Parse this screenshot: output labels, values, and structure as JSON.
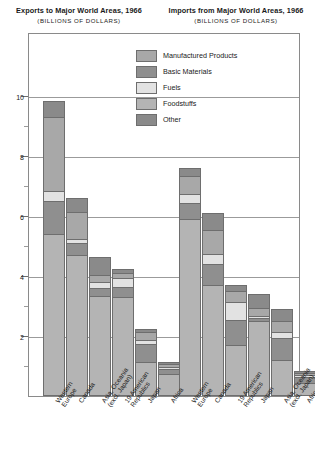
{
  "panels": {
    "left": {
      "title": "Exports to Major World Areas, 1966",
      "subtitle": "(BILLIONS  OF  DOLLARS)"
    },
    "right": {
      "title": "Imports from Major World Areas, 1966",
      "subtitle": "(BILLIONS  OF  DOLLARS)"
    }
  },
  "legend": {
    "items": [
      {
        "label": "Manufactured Products",
        "color": "#a8a8a8"
      },
      {
        "label": "Basic Materials",
        "color": "#8f8f8f"
      },
      {
        "label": "Fuels",
        "color": "#e2e2e2"
      },
      {
        "label": "Foodstuffs",
        "color": "#b4b4b4"
      },
      {
        "label": "Other",
        "color": "#8a8a8a"
      }
    ]
  },
  "axis": {
    "ticks": [
      "10",
      "8",
      "6",
      "4",
      "2"
    ],
    "tick_values": [
      10,
      8,
      6,
      4,
      2
    ],
    "minor_values": [
      1,
      3,
      5,
      7,
      9
    ],
    "ymin": 0,
    "ymax": 11
  },
  "chart_data": {
    "type": "bar",
    "subtype": "stacked-bar",
    "panels": 2,
    "xlabel": "",
    "ylabel": "BILLIONS OF DOLLARS",
    "ylim": [
      0,
      11
    ],
    "yticks": [
      2,
      4,
      6,
      8,
      10
    ],
    "grid": true,
    "legend_position": "top-center",
    "series_names": [
      "Manufactured Products",
      "Basic Materials",
      "Fuels",
      "Foodstuffs",
      "Other"
    ],
    "charts": [
      {
        "name": "Exports to Major World Areas, 1966",
        "categories": [
          "Western Europe",
          "Canada",
          "Asia, Oceania (excl. Japan)",
          "19 American Republics",
          "Japan",
          "Africa"
        ],
        "series": [
          {
            "name": "Foodstuffs",
            "values": [
              5.4,
              4.7,
              3.35,
              3.3,
              1.15,
              0.75
            ]
          },
          {
            "name": "Basic Materials",
            "values": [
              1.1,
              0.4,
              0.25,
              0.35,
              0.6,
              0.15
            ]
          },
          {
            "name": "Fuels",
            "values": [
              0.35,
              0.15,
              0.2,
              0.3,
              0.12,
              0.08
            ]
          },
          {
            "name": "Manufactured Products",
            "values": [
              2.45,
              0.9,
              0.25,
              0.15,
              0.25,
              0.1
            ]
          },
          {
            "name": "Other",
            "values": [
              0.55,
              0.45,
              0.6,
              0.15,
              0.1,
              0.07
            ]
          }
        ],
        "totals": [
          9.85,
          6.6,
          4.65,
          4.25,
          2.22,
          1.15
        ]
      },
      {
        "name": "Imports from Major World Areas, 1966",
        "categories": [
          "Western Europe",
          "Canada",
          "19 American Republics",
          "Japan",
          "Asia, Oceania (excl. Japan)",
          "Africa"
        ],
        "series": [
          {
            "name": "Foodstuffs",
            "values": [
              5.9,
              3.7,
              1.7,
              2.5,
              1.2,
              0.45
            ]
          },
          {
            "name": "Basic Materials",
            "values": [
              0.55,
              0.7,
              0.85,
              0.1,
              0.75,
              0.2
            ]
          },
          {
            "name": "Fuels",
            "values": [
              0.3,
              0.35,
              0.6,
              0.08,
              0.2,
              0.05
            ]
          },
          {
            "name": "Manufactured Products",
            "values": [
              0.6,
              0.8,
              0.35,
              0.25,
              0.35,
              0.08
            ]
          },
          {
            "name": "Other",
            "values": [
              0.25,
              0.55,
              0.2,
              0.47,
              0.4,
              0.07
            ]
          }
        ],
        "totals": [
          7.6,
          6.1,
          3.7,
          3.4,
          2.9,
          0.85
        ]
      }
    ]
  }
}
